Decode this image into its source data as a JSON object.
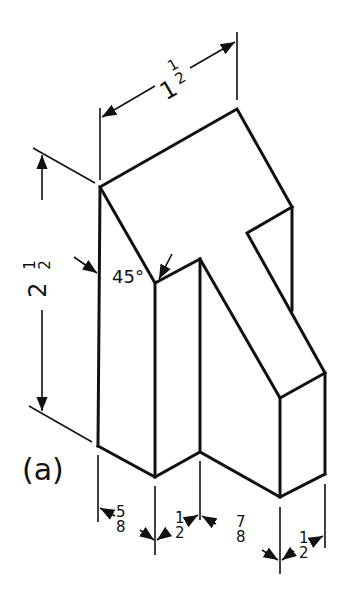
{
  "figure": {
    "caption": "(a)",
    "angle_label": "45°",
    "dimensions": {
      "top_width": {
        "whole": "1",
        "num": "1",
        "den": "2"
      },
      "height": {
        "whole": "2",
        "num": "1",
        "den": "2"
      },
      "bottom": [
        {
          "num": "5",
          "den": "8"
        },
        {
          "num": "1",
          "den": "2"
        },
        {
          "num": "7",
          "den": "8"
        },
        {
          "num": "1",
          "den": "2"
        }
      ]
    },
    "colors": {
      "ink": "#111111",
      "paper": "#ffffff"
    }
  }
}
